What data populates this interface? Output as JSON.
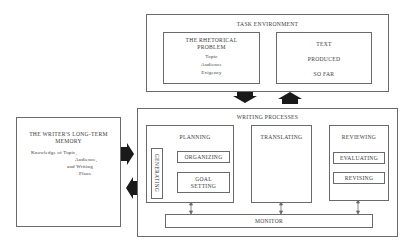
{
  "task_environment": {
    "title": "TASK ENVIRONMENT",
    "rhetorical_problem": {
      "title_line1": "THE RHETORICAL",
      "title_line2": "PROBLEM",
      "items": [
        "Topic",
        "Audience",
        "Exigency"
      ]
    },
    "text_produced": {
      "line1": "TEXT",
      "line2": "PRODUCED",
      "line3": "SO FAR"
    }
  },
  "long_term_memory": {
    "title_line1": "THE WRITER'S LONG-TERM",
    "title_line2": "MEMORY",
    "desc_lines": [
      "Knowledge of Topic,",
      "Audience,",
      "and Writing",
      "Plans"
    ]
  },
  "writing_processes": {
    "title": "WRITING PROCESSES",
    "planning": {
      "title": "PLANNING",
      "generating": "GENERATING",
      "organizing": "ORGANIZING",
      "goal_setting_line1": "GOAL",
      "goal_setting_line2": "SETTING"
    },
    "translating": {
      "title": "TRANSLATING"
    },
    "reviewing": {
      "title": "REVIEWING",
      "evaluating": "EVALUATING",
      "revising": "REVISING"
    },
    "monitor": {
      "title": "MONITOR"
    }
  },
  "colors": {
    "line": "#6a6a6a",
    "arrow": "#1a1a1a",
    "text": "#3a3a3a",
    "background": "#ffffff"
  }
}
